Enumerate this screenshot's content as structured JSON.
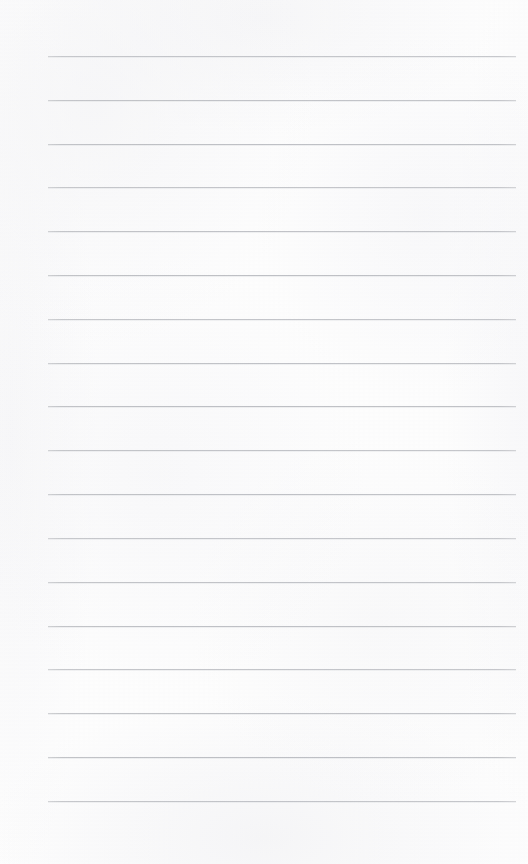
{
  "page": {
    "kind": "ruled-notebook-paper",
    "width": 528,
    "height": 864,
    "paper_color": "#fdfdfd",
    "background_color": "#ffffff",
    "content_text": "",
    "has_writing": false,
    "has_header_text": false,
    "has_page_number": false,
    "has_margin_rule": false
  },
  "ruling": {
    "line_count": 18,
    "line_color": "#b6b8bd",
    "line_thickness_px": 1,
    "line_spacing_px": 43.8,
    "first_line_y": 56,
    "line_start_x": 48,
    "line_end_x": 516,
    "line_length_px": 468,
    "lines_y": [
      56,
      100,
      144,
      187,
      231,
      275,
      319,
      363,
      406,
      450,
      494,
      538,
      582,
      626,
      669,
      713,
      757,
      801
    ]
  }
}
